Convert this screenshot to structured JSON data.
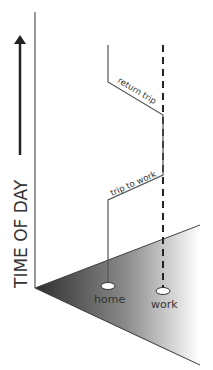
{
  "axis": {
    "label": "TIME OF DAY"
  },
  "places": {
    "home": "home",
    "work": "work"
  },
  "trips": {
    "return": "return trip",
    "to_work": "trip to work"
  },
  "colors": {
    "ink": "#333333",
    "plane_dark": "#333333",
    "plane_light": "#ffffff"
  }
}
